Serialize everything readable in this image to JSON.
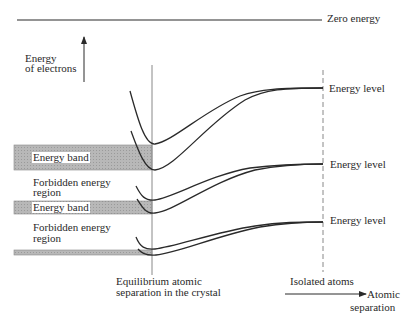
{
  "diagram": {
    "zero_energy_label": "Zero energy",
    "y_axis_label_line1": "Energy",
    "y_axis_label_line2": "of electrons",
    "x_axis_label_line1": "Atomic",
    "x_axis_label_line2": "separation",
    "equilibrium_label_line1": "Equilibrium atomic",
    "equilibrium_label_line2": "separation in the crystal",
    "isolated_atoms_label": "Isolated atoms",
    "energy_levels": [
      {
        "label": "Energy level"
      },
      {
        "label": "Energy level"
      },
      {
        "label": "Energy level"
      }
    ],
    "regions": [
      {
        "label": "Energy band",
        "type": "band"
      },
      {
        "label_line1": "Forbidden energy",
        "label_line2": "region",
        "type": "forbidden"
      },
      {
        "label": "Energy band",
        "type": "band"
      },
      {
        "label_line1": "Forbidden energy",
        "label_line2": "region",
        "type": "forbidden"
      }
    ],
    "colors": {
      "band_fill": "#b4b4b4",
      "line": "#2a2a2a",
      "equilibrium_line": "#888888"
    }
  }
}
